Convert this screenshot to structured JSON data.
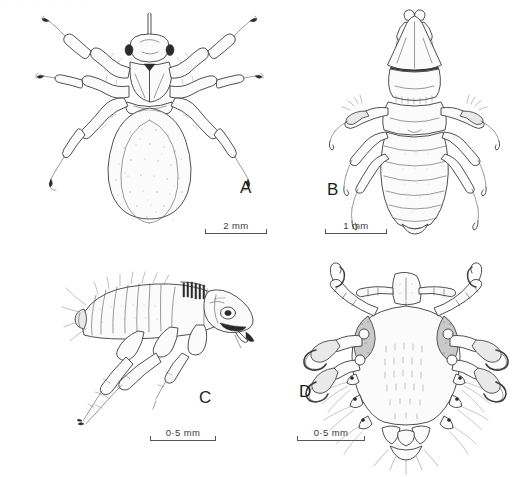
{
  "figure": {
    "type": "scientific-illustration-plate",
    "medium": "pen-and-ink line drawing",
    "background_color": "#ffffff",
    "ink_color": "#3c3c3c",
    "layout": "2x2 grid of labelled panels",
    "top_cropped_artifact": ". . . . . ."
  },
  "panels": [
    {
      "letter": "A",
      "subject": "soft tick / bed-bug-like arthropod, dorsal view",
      "orientation": "dorsal",
      "letter_x": 240,
      "letter_y": 178,
      "scale": {
        "label": "2 mm",
        "x": 205,
        "y": 232,
        "width": 62
      }
    },
    {
      "letter": "B",
      "subject": "body louse, dorsal view",
      "orientation": "dorsal",
      "letter_x": 327,
      "letter_y": 180,
      "scale": {
        "label": "1 mm",
        "x": 325,
        "y": 232,
        "width": 62
      }
    },
    {
      "letter": "C",
      "subject": "flea, lateral view",
      "orientation": "lateral",
      "letter_x": 199,
      "letter_y": 388,
      "scale": {
        "label": "0·5 mm",
        "x": 150,
        "y": 439,
        "width": 66
      }
    },
    {
      "letter": "D",
      "subject": "crab (pubic) louse, dorsal view",
      "orientation": "dorsal",
      "letter_x": 299,
      "letter_y": 382,
      "scale": {
        "label": "0·5 mm",
        "x": 297,
        "y": 439,
        "width": 68
      }
    }
  ]
}
